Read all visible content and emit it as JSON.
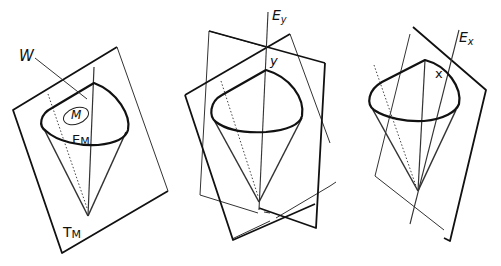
{
  "figures": [
    {
      "id": "left",
      "description": "Cone-shaped cup inside plane T_M",
      "labels": {
        "w": "W",
        "m": "M",
        "em_main": "E",
        "em_sub": "M",
        "tm_main": "T",
        "tm_sub": "M"
      }
    },
    {
      "id": "middle",
      "description": "Cone cut by two intersecting planes with axis E_y",
      "labels": {
        "ey_main": "E",
        "ey_sub": "y",
        "y": "y"
      }
    },
    {
      "id": "right",
      "description": "Cone with inclined plane and axis E_x",
      "labels": {
        "ex_main": "E",
        "ex_sub": "x",
        "x": "x"
      }
    }
  ],
  "colors": {
    "stroke": "#111111",
    "background": "#ffffff"
  }
}
